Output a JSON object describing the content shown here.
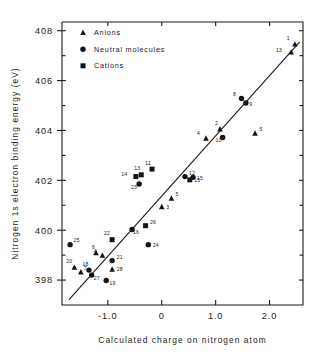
{
  "chart_data": {
    "type": "scatter",
    "title": "",
    "xlabel": "Calculated charge on nitrogen atom",
    "ylabel": "Nitrogen 1s electron binding energy (eV)",
    "xlim": [
      -1.85,
      2.62
    ],
    "ylim": [
      397.0,
      408.35
    ],
    "xticks": [
      -1.0,
      0,
      1.0,
      2.0
    ],
    "xticklabels": [
      "-1.0",
      "0",
      "1.0",
      "2.0"
    ],
    "yticks": [
      398,
      400,
      402,
      404,
      406,
      408
    ],
    "yticklabels": [
      "398",
      "400",
      "402",
      "404",
      "406",
      "408"
    ],
    "yminorticks": [
      399,
      401,
      403,
      405,
      407
    ],
    "grid": false,
    "legend_position": "upper-left-inside",
    "legend": [
      {
        "label": "Anions",
        "marker": "triangle"
      },
      {
        "label": "Neutral molecules",
        "marker": "circle"
      },
      {
        "label": "Cations",
        "marker": "square"
      }
    ],
    "fit_line": {
      "x": [
        -1.72,
        2.56
      ],
      "y": [
        397.22,
        407.55
      ]
    },
    "series": [
      {
        "name": "Anions",
        "marker": "triangle",
        "points": [
          {
            "id": "1",
            "x": 2.47,
            "y": 407.45,
            "lx": -5.0,
            "ly": -4.0
          },
          {
            "id": "13",
            "x": 2.4,
            "y": 407.13,
            "lx": -9.0,
            "ly": -0.5
          },
          {
            "id": "2",
            "x": 1.08,
            "y": 404.05,
            "lx": -2.0,
            "ly": -4.5
          },
          {
            "id": "4",
            "x": 0.82,
            "y": 403.68,
            "lx": -6.0,
            "ly": -3.0
          },
          {
            "id": "5",
            "x": 1.73,
            "y": 403.88,
            "lx": 4.5,
            "ly": -2.5
          },
          {
            "id": "5b",
            "x": 0.18,
            "y": 401.27,
            "lx": 4.0,
            "ly": -2.5
          },
          {
            "id": "3",
            "x": 0.0,
            "y": 400.93,
            "lx": 4.5,
            "ly": 1.8
          },
          {
            "id": "6",
            "x": -1.22,
            "y": 399.08,
            "lx": -1.0,
            "ly": -4.2
          },
          {
            "id": "4b",
            "x": -1.1,
            "y": 398.98,
            "lx": -5.5,
            "ly": -2.2
          },
          {
            "id": "20",
            "x": -1.62,
            "y": 398.5,
            "lx": -2.0,
            "ly": -4.5
          },
          {
            "id": "7",
            "x": -1.5,
            "y": 398.31,
            "lx": 2.8,
            "ly": -2.2
          },
          {
            "id": "28",
            "x": -0.92,
            "y": 398.42,
            "lx": 4.5,
            "ly": 1.8
          }
        ]
      },
      {
        "name": "Neutral molecules",
        "marker": "circle",
        "points": [
          {
            "id": "8",
            "x": 1.48,
            "y": 405.28,
            "lx": -5.5,
            "ly": -2.5
          },
          {
            "id": "9",
            "x": 1.56,
            "y": 405.1,
            "lx": 3.5,
            "ly": 2.5
          },
          {
            "id": "10",
            "x": 1.13,
            "y": 403.72,
            "lx": -1.0,
            "ly": 4.5
          },
          {
            "id": "12",
            "x": 0.43,
            "y": 402.15,
            "lx": 4.0,
            "ly": -2.0
          },
          {
            "id": "23",
            "x": -0.42,
            "y": 401.85,
            "lx": -2.0,
            "ly": 4.8
          },
          {
            "id": "16",
            "x": -0.55,
            "y": 400.03,
            "lx": 1.0,
            "ly": 4.8
          },
          {
            "id": "24",
            "x": -0.25,
            "y": 399.42,
            "lx": 4.5,
            "ly": 2.5
          },
          {
            "id": "25",
            "x": -1.7,
            "y": 399.42,
            "lx": 3.5,
            "ly": -2.2
          },
          {
            "id": "21",
            "x": -0.92,
            "y": 398.78,
            "lx": 4.5,
            "ly": -1.5
          },
          {
            "id": "18",
            "x": -1.35,
            "y": 398.4,
            "lx": -0.5,
            "ly": -4.2
          },
          {
            "id": "27",
            "x": -1.3,
            "y": 398.2,
            "lx": 2.0,
            "ly": 5.2
          },
          {
            "id": "19",
            "x": -1.03,
            "y": 397.98,
            "lx": 3.2,
            "ly": 4.5
          },
          {
            "id": "15b",
            "x": 0.58,
            "y": 402.12,
            "lx": 4.0,
            "ly": 2.2
          }
        ]
      },
      {
        "name": "Cations",
        "marker": "square",
        "points": [
          {
            "id": "11",
            "x": -0.18,
            "y": 402.45,
            "lx": -1.0,
            "ly": -4.5
          },
          {
            "id": "13b",
            "x": -0.38,
            "y": 402.22,
            "lx": -1.0,
            "ly": -4.5
          },
          {
            "id": "14",
            "x": -0.48,
            "y": 402.15,
            "lx": -8.5,
            "ly": -1.0
          },
          {
            "id": "15",
            "x": 0.52,
            "y": 402.02,
            "lx": 4.5,
            "ly": 2.2
          },
          {
            "id": "26",
            "x": -0.3,
            "y": 400.18,
            "lx": 4.5,
            "ly": -2.0
          },
          {
            "id": "22",
            "x": -0.92,
            "y": 399.62,
            "lx": -2.0,
            "ly": -4.5
          }
        ]
      }
    ]
  }
}
